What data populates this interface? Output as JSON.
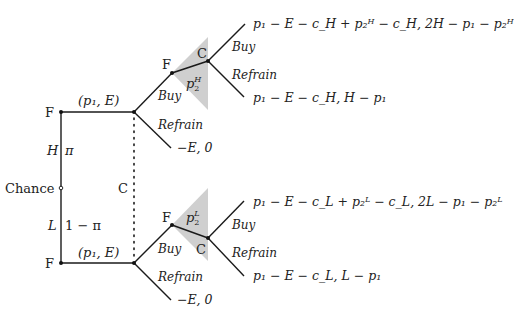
{
  "diagram": {
    "type": "extensive-form game tree",
    "colors": {
      "line": "#1a1a1a",
      "shade": "#cfcfcf",
      "text": "#222222"
    },
    "root": {
      "label": "Chance"
    },
    "branches": {
      "high": {
        "type": "H",
        "prob": "π"
      },
      "low": {
        "type": "L",
        "prob": "1 − π"
      }
    },
    "information_set_label": "C",
    "firm_label": "F",
    "consumer_label": "C",
    "first_offer": "(p₁, E)",
    "actions": {
      "buy": "Buy",
      "refrain": "Refrain"
    },
    "top": {
      "second_price": {
        "base": "p",
        "sub": "2",
        "sup": "H"
      },
      "payoff_buy": "p₁ − E − c_H + p₂ᴴ − c_H, 2H − p₁ − p₂ᴴ",
      "payoff_refrain_after": "p₁ − E − c_H, H − p₁",
      "payoff_refrain_first": "−E, 0"
    },
    "bottom": {
      "second_price": {
        "base": "p",
        "sub": "2",
        "sup": "L"
      },
      "payoff_buy": "p₁ − E − c_L + p₂ᴸ − c_L, 2L − p₁ − p₂ᴸ",
      "payoff_refrain_after": "p₁ − E − c_L, L − p₁",
      "payoff_refrain_first": "−E, 0"
    }
  }
}
